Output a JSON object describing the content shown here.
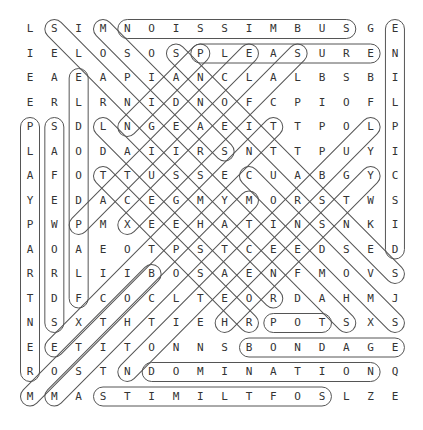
{
  "grid": {
    "rows": 16,
    "cols": 16,
    "origin_x": 30,
    "origin_y": 29,
    "step_x": 24.33,
    "step_y": 24.5,
    "letters": [
      "LSIMNOISSIMBUSGE",
      "IELOSOSPLEASUREN",
      "EAEAPIANCLALBSBI",
      "ERLRNIDNOFCPIOFL",
      "PSDLNGEAEITTPOLP",
      "LAODAIIRSNTTPUYI",
      "AFOTTUSSECUABGYC",
      "YEDACEGMYMORSTWS",
      "PWPMXEEHATINSNKI",
      "AOAEOTPSTCEEDSED",
      "RRLIIBOSAENFMOVS",
      "TDFCOCLTEORDAHMJ",
      "NSXTHTIEHRPOTSXS",
      "EETITONNSBONDAGE",
      "ROSTNDOMINATIONQ",
      "MMASTIMILTFOSLZE"
    ]
  },
  "colors": {
    "letter": "#333333",
    "ring": "#555555",
    "background": "#ffffff"
  },
  "found_words": [
    {
      "word": "SUBMISSION",
      "start": [
        0,
        13
      ],
      "end": [
        0,
        4
      ]
    },
    {
      "word": "PLEASURE",
      "start": [
        1,
        7
      ],
      "end": [
        1,
        14
      ]
    },
    {
      "word": "DISCIPLINE",
      "start": [
        9,
        15
      ],
      "end": [
        0,
        15
      ]
    },
    {
      "word": "PLAYPARTNER",
      "start": [
        4,
        0
      ],
      "end": [
        14,
        0
      ]
    },
    {
      "word": "SAFEWORDS",
      "start": [
        4,
        1
      ],
      "end": [
        12,
        1
      ]
    },
    {
      "word": "FLAPDOODLE",
      "start": [
        11,
        2
      ],
      "end": [
        2,
        2
      ]
    },
    {
      "word": "SADISM",
      "start": [
        5,
        8
      ],
      "end": [
        0,
        3
      ]
    },
    {
      "word": "SAFETYSIGNALS",
      "start": [
        12,
        13
      ],
      "end": [
        0,
        1
      ]
    },
    {
      "word": "PAIN",
      "start": [
        1,
        7
      ],
      "end": [
        4,
        4
      ]
    },
    {
      "word": "SENSATIONS",
      "start": [
        10,
        15
      ],
      "end": [
        1,
        6
      ]
    },
    {
      "word": "LAUGHTER",
      "start": [
        4,
        3
      ],
      "end": [
        11,
        10
      ]
    },
    {
      "word": "RESPECT",
      "start": [
        12,
        9
      ],
      "end": [
        6,
        3
      ]
    },
    {
      "word": "CONDOMS",
      "start": [
        6,
        9
      ],
      "end": [
        12,
        15
      ]
    },
    {
      "word": "PATIENCE",
      "start": [
        8,
        2
      ],
      "end": [
        1,
        9
      ]
    },
    {
      "word": "SAFERSEX",
      "start": [
        1,
        11
      ],
      "end": [
        8,
        4
      ]
    },
    {
      "word": "EXCITEMENT",
      "start": [
        13,
        1
      ],
      "end": [
        4,
        10
      ]
    },
    {
      "word": "BOTTOM",
      "start": [
        10,
        5
      ],
      "end": [
        15,
        0
      ]
    },
    {
      "word": "MASOCHISM",
      "start": [
        7,
        9
      ],
      "end": [
        15,
        1
      ]
    },
    {
      "word": "LUBRICATION",
      "start": [
        4,
        14
      ],
      "end": [
        14,
        4
      ]
    },
    {
      "word": "HONESTY",
      "start": [
        12,
        8
      ],
      "end": [
        6,
        14
      ]
    },
    {
      "word": "TOP",
      "start": [
        12,
        12
      ],
      "end": [
        12,
        10
      ]
    },
    {
      "word": "BONDAGE",
      "start": [
        13,
        9
      ],
      "end": [
        13,
        15
      ]
    },
    {
      "word": "DOMINATION",
      "start": [
        14,
        5
      ],
      "end": [
        14,
        14
      ]
    },
    {
      "word": "SOFTLIMITS",
      "start": [
        15,
        12
      ],
      "end": [
        15,
        3
      ]
    }
  ]
}
